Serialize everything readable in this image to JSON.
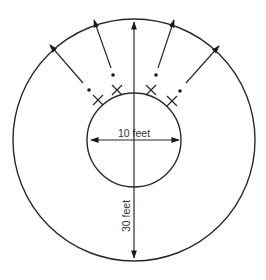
{
  "diagram": {
    "type": "concentric-circle-dimension-diagram",
    "inner_circle": {
      "diameter_label": "10 feet",
      "center": [
        134,
        140
      ],
      "radius": 47
    },
    "outer_circle": {
      "diameter_label": "30 feet",
      "center": [
        134,
        140
      ],
      "radius": 121
    },
    "colors": {
      "line": "#2a2a2a",
      "text": "#333333",
      "background": "#ffffff"
    },
    "markers": {
      "x_marks": [
        {
          "id": "x1",
          "pos": [
            98,
            100
          ]
        },
        {
          "id": "x2",
          "pos": [
            117,
            90
          ]
        },
        {
          "id": "x3",
          "pos": [
            151,
            90
          ]
        },
        {
          "id": "x4",
          "pos": [
            172,
            101
          ]
        }
      ],
      "dots": [
        {
          "id": "d1",
          "pos": [
            89,
            90
          ]
        },
        {
          "id": "d2",
          "pos": [
            113,
            75
          ]
        },
        {
          "id": "d3",
          "pos": [
            156,
            75
          ]
        },
        {
          "id": "d4",
          "pos": [
            180,
            91
          ]
        }
      ]
    },
    "radial_arrows": [
      {
        "id": "a1",
        "from": [
          83,
          83
        ],
        "to": [
          50,
          45
        ]
      },
      {
        "id": "a2",
        "from": [
          111,
          69
        ],
        "to": [
          94,
          20
        ]
      },
      {
        "id": "a3",
        "from": [
          158,
          69
        ],
        "to": [
          174,
          20
        ]
      },
      {
        "id": "a4",
        "from": [
          186,
          83
        ],
        "to": [
          219,
          46
        ]
      }
    ]
  }
}
